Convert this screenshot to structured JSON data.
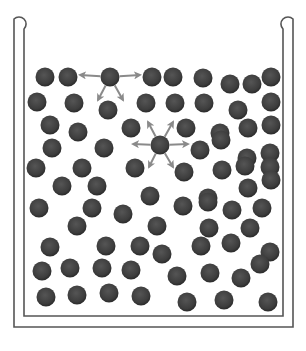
{
  "diagram": {
    "title": "",
    "colors": {
      "background": "#ffffff",
      "wall": "#555555",
      "molecule": "#3d3d3d",
      "molecule_edge": "#2a2a2a",
      "arrow": "#8a8a8a"
    },
    "container": {
      "outer": {
        "left": 14,
        "right": 293,
        "top": 14,
        "bottom": 327
      },
      "inner": {
        "left": 24,
        "right": 283,
        "top": 24,
        "bottom": 316
      }
    },
    "molecule_radius": 9.5,
    "molecules": [
      [
        45,
        77
      ],
      [
        68,
        77
      ],
      [
        110,
        77
      ],
      [
        152,
        77
      ],
      [
        173,
        77
      ],
      [
        203,
        78
      ],
      [
        230,
        84
      ],
      [
        252,
        84
      ],
      [
        271,
        77
      ],
      [
        37,
        102
      ],
      [
        74,
        103
      ],
      [
        108,
        110
      ],
      [
        146,
        103
      ],
      [
        175,
        103
      ],
      [
        204,
        103
      ],
      [
        238,
        110
      ],
      [
        271,
        102
      ],
      [
        50,
        125
      ],
      [
        78,
        132
      ],
      [
        131,
        128
      ],
      [
        186,
        128
      ],
      [
        220,
        133
      ],
      [
        248,
        128
      ],
      [
        271,
        125
      ],
      [
        52,
        148
      ],
      [
        104,
        148
      ],
      [
        160,
        145
      ],
      [
        200,
        150
      ],
      [
        221,
        140
      ],
      [
        247,
        158
      ],
      [
        270,
        153
      ],
      [
        36,
        168
      ],
      [
        82,
        168
      ],
      [
        135,
        168
      ],
      [
        184,
        172
      ],
      [
        222,
        170
      ],
      [
        245,
        166
      ],
      [
        270,
        167
      ],
      [
        62,
        186
      ],
      [
        97,
        186
      ],
      [
        150,
        196
      ],
      [
        208,
        198
      ],
      [
        248,
        188
      ],
      [
        271,
        180
      ],
      [
        39,
        208
      ],
      [
        92,
        208
      ],
      [
        123,
        214
      ],
      [
        183,
        206
      ],
      [
        208,
        202
      ],
      [
        232,
        210
      ],
      [
        262,
        208
      ],
      [
        77,
        226
      ],
      [
        157,
        226
      ],
      [
        209,
        228
      ],
      [
        250,
        228
      ],
      [
        50,
        247
      ],
      [
        106,
        246
      ],
      [
        140,
        246
      ],
      [
        162,
        254
      ],
      [
        201,
        246
      ],
      [
        231,
        243
      ],
      [
        270,
        252
      ],
      [
        42,
        271
      ],
      [
        70,
        268
      ],
      [
        102,
        268
      ],
      [
        131,
        270
      ],
      [
        177,
        276
      ],
      [
        210,
        273
      ],
      [
        241,
        278
      ],
      [
        260,
        264
      ],
      [
        46,
        297
      ],
      [
        77,
        295
      ],
      [
        109,
        293
      ],
      [
        141,
        296
      ],
      [
        187,
        302
      ],
      [
        224,
        300
      ],
      [
        268,
        302
      ]
    ],
    "force_arrows": [
      {
        "from": [
          110,
          77
        ],
        "to": [
          80,
          75
        ],
        "label": "left"
      },
      {
        "from": [
          110,
          77
        ],
        "to": [
          140,
          75
        ],
        "label": "right"
      },
      {
        "from": [
          110,
          77
        ],
        "to": [
          98,
          100
        ],
        "label": "down-left"
      },
      {
        "from": [
          110,
          77
        ],
        "to": [
          123,
          100
        ],
        "label": "down-right"
      },
      {
        "from": [
          160,
          145
        ],
        "to": [
          148,
          122
        ],
        "label": "up-left"
      },
      {
        "from": [
          160,
          145
        ],
        "to": [
          173,
          122
        ],
        "label": "up-right"
      },
      {
        "from": [
          160,
          145
        ],
        "to": [
          133,
          144
        ],
        "label": "left"
      },
      {
        "from": [
          160,
          145
        ],
        "to": [
          188,
          144
        ],
        "label": "right"
      },
      {
        "from": [
          160,
          145
        ],
        "to": [
          149,
          167
        ],
        "label": "down-left"
      },
      {
        "from": [
          160,
          145
        ],
        "to": [
          173,
          167
        ],
        "label": "down-right"
      }
    ]
  }
}
